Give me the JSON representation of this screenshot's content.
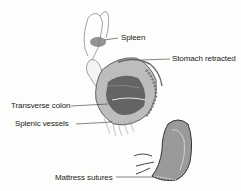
{
  "diagram": {
    "type": "surgical illustration",
    "labels": {
      "spleen": "Spleen",
      "stomach": "Stomach retracted",
      "colon": "Transverse colon",
      "vessels": "Splenic vessels",
      "sutures": "Mattress sutures"
    }
  }
}
